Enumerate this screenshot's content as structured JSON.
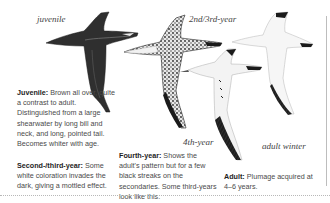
{
  "figure": {
    "labels": {
      "juvenile": "juvenile",
      "second_third_year": "2nd/3rd-year",
      "fourth_year": "4th-year",
      "adult_winter": "adult winter"
    },
    "birds": [
      {
        "id": "juvenile",
        "plumage": "dark brown"
      },
      {
        "id": "2nd-3rd-year",
        "plumage": "mottled"
      },
      {
        "id": "4th-year",
        "plumage": "white with black streaks on secondaries"
      },
      {
        "id": "adult-winter",
        "plumage": "white with black wingtips"
      }
    ]
  },
  "captions": {
    "juvenile": {
      "heading": "Juvenile:",
      "text": " Brown all over, quite a contrast to adult. Distinguished from a large shearwater by long bill and neck, and long, pointed tail. Becomes whiter with age."
    },
    "second_third_year": {
      "heading": "Second-/third-year:",
      "text": " Some white coloration invades the dark, giving a mottled effect."
    },
    "fourth_year": {
      "heading": "Fourth-year:",
      "text": " Shows the adult's pattern but for a few black streaks on the secondaries. Some third-years look like this."
    },
    "adult": {
      "heading": "Adult:",
      "text": " Plumage acquired at 4–6 years."
    }
  },
  "colors": {
    "dark_plumage": "#2e2e2e",
    "mottle": "#555555",
    "white_plumage": "#f4f4f4",
    "wingtip": "#151515",
    "rule": "#bdbdbd"
  }
}
